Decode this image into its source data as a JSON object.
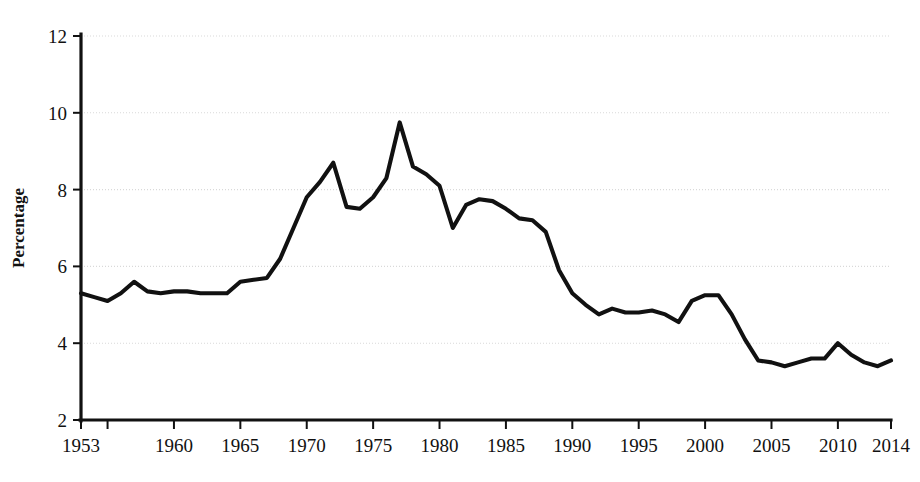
{
  "chart_data": {
    "type": "line",
    "title": "",
    "subtitle": "",
    "xlabel": "",
    "ylabel": "Percentage",
    "xlim": [
      1953,
      2014
    ],
    "ylim": [
      2,
      12
    ],
    "grid": true,
    "legend": false,
    "legend_position": "none",
    "line_color": "#111111",
    "xtick_labels": [
      "1953",
      "1960",
      "1965",
      "1970",
      "1975",
      "1980",
      "1985",
      "1990",
      "1995",
      "2000",
      "2005",
      "2010",
      "2014"
    ],
    "xtick_values": [
      1953,
      1960,
      1965,
      1970,
      1975,
      1980,
      1985,
      1990,
      1995,
      2000,
      2005,
      2010,
      2014
    ],
    "xtick_minor_values": [
      1955
    ],
    "ytick_labels": [
      "2",
      "4",
      "6",
      "8",
      "10",
      "12"
    ],
    "ytick_values": [
      2,
      4,
      6,
      8,
      10,
      12
    ],
    "x": [
      1953,
      1954,
      1955,
      1956,
      1957,
      1958,
      1959,
      1960,
      1961,
      1962,
      1963,
      1964,
      1965,
      1966,
      1967,
      1968,
      1969,
      1970,
      1971,
      1972,
      1973,
      1974,
      1975,
      1976,
      1977,
      1978,
      1979,
      1980,
      1981,
      1982,
      1983,
      1984,
      1985,
      1986,
      1987,
      1988,
      1989,
      1990,
      1991,
      1992,
      1993,
      1994,
      1995,
      1996,
      1997,
      1998,
      1999,
      2000,
      2001,
      2002,
      2003,
      2004,
      2005,
      2006,
      2007,
      2008,
      2009,
      2010,
      2011,
      2012,
      2013,
      2014
    ],
    "values": [
      5.3,
      5.2,
      5.1,
      5.3,
      5.6,
      5.35,
      5.3,
      5.35,
      5.35,
      5.3,
      5.3,
      5.3,
      5.6,
      5.65,
      5.7,
      6.2,
      7.0,
      7.8,
      8.2,
      8.7,
      7.55,
      7.5,
      7.8,
      8.3,
      9.75,
      8.6,
      8.4,
      8.1,
      7.0,
      7.6,
      7.75,
      7.7,
      7.5,
      7.25,
      7.2,
      6.9,
      5.9,
      5.3,
      5.0,
      4.75,
      4.9,
      4.8,
      4.8,
      4.85,
      4.75,
      4.55,
      5.1,
      5.25,
      5.25,
      4.75,
      4.1,
      3.55,
      3.5,
      3.4,
      3.5,
      3.6,
      3.6,
      4.0,
      3.7,
      3.5,
      3.4,
      3.55
    ],
    "series": [
      {
        "name": "Percentage",
        "values": [
          5.3,
          5.2,
          5.1,
          5.3,
          5.6,
          5.35,
          5.3,
          5.35,
          5.35,
          5.3,
          5.3,
          5.3,
          5.6,
          5.65,
          5.7,
          6.2,
          7.0,
          7.8,
          8.2,
          8.7,
          7.55,
          7.5,
          7.8,
          8.3,
          9.75,
          8.6,
          8.4,
          8.1,
          7.0,
          7.6,
          7.75,
          7.7,
          7.5,
          7.25,
          7.2,
          6.9,
          5.9,
          5.3,
          5.0,
          4.75,
          4.9,
          4.8,
          4.8,
          4.85,
          4.75,
          4.55,
          5.1,
          5.25,
          5.25,
          4.75,
          4.1,
          3.55,
          3.5,
          3.4,
          3.5,
          3.6,
          3.6,
          4.0,
          3.7,
          3.5,
          3.4,
          3.55
        ]
      }
    ],
    "annotations": []
  }
}
